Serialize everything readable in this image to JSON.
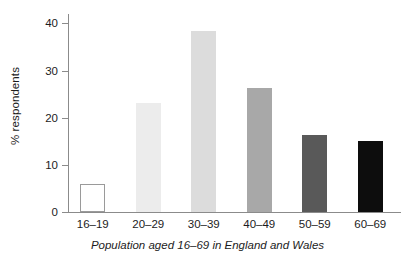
{
  "chart_data": {
    "type": "bar",
    "title": "",
    "subtitle": "",
    "xlabel": "Population aged 16–69 in England and Wales",
    "ylabel": "% respondents",
    "categories": [
      "16–19",
      "20–29",
      "30–39",
      "40–49",
      "50–59",
      "60–69"
    ],
    "values": [
      5.9,
      23.2,
      38.3,
      26.4,
      16.4,
      15.0
    ],
    "series": [
      {
        "name": "% respondents",
        "values": [
          5.9,
          23.2,
          38.3,
          26.4,
          16.4,
          15.0
        ]
      }
    ],
    "bar_colors": [
      "#ffffff",
      "#ececec",
      "#dcdcdc",
      "#a8a8a8",
      "#595959",
      "#0d0d0d"
    ],
    "bar_border_colors": [
      "#9a9a9a",
      "none",
      "none",
      "none",
      "none",
      "none"
    ],
    "ylim": [
      0,
      42
    ],
    "yticks": [
      0,
      10,
      20,
      30,
      40
    ],
    "ytick_labels": [
      "0",
      "10",
      "20",
      "30",
      "40"
    ],
    "grid": false,
    "legend": null,
    "legend_position": "none",
    "axis_color": "#8b8b8b"
  },
  "axes": {
    "y_axis_label": "% respondents",
    "x_axis_label": "Population aged 16–69 in England and Wales"
  }
}
